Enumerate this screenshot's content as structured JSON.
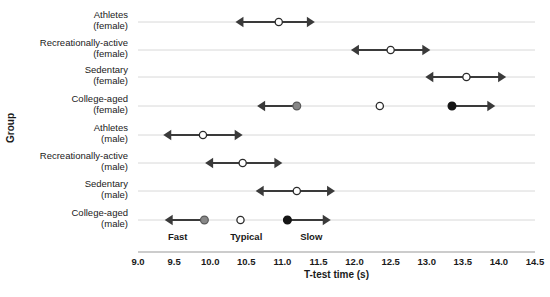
{
  "chart_data": {
    "type": "scatter",
    "title": "",
    "xlabel": "T-test time (s)",
    "ylabel": "Group",
    "xlim": [
      9.0,
      14.5
    ],
    "grid": true,
    "legend": "none",
    "xticks": [
      "9.0",
      "9.5",
      "10.0",
      "10.5",
      "11.0",
      "11.5",
      "12.0",
      "12.5",
      "13.0",
      "13.5",
      "14.0",
      "14.5"
    ],
    "xtick_values": [
      9.0,
      9.5,
      10.0,
      10.5,
      11.0,
      11.5,
      12.0,
      12.5,
      13.0,
      13.5,
      14.0,
      14.5
    ],
    "categories": [
      "Athletes\n(female)",
      "Recreationally-active\n(female)",
      "Sedentary\n(female)",
      "College-aged\n(female)",
      "Athletes\n(male)",
      "Recreationally-active\n(male)",
      "Sedentary\n(male)",
      "College-aged\n(male)"
    ],
    "category_lines": [
      [
        "Athletes",
        "(female)"
      ],
      [
        "Recreationally-active",
        "(female)"
      ],
      [
        "Sedentary",
        "(female)"
      ],
      [
        "College-aged",
        "(female)"
      ],
      [
        "Athletes",
        "(male)"
      ],
      [
        "Recreationally-active",
        "(male)"
      ],
      [
        "Sedentary",
        "(male)"
      ],
      [
        "College-aged",
        "(male)"
      ]
    ],
    "zone_labels": [
      {
        "text": "Fast",
        "x": 9.55
      },
      {
        "text": "Typical",
        "x": 10.5
      },
      {
        "text": "Slow",
        "x": 11.4
      }
    ],
    "rows": [
      {
        "group": "Athletes (female)",
        "points": [
          {
            "value": 10.95,
            "marker": "open",
            "range_start": 10.35,
            "range_end": 11.45,
            "arrow_left": true,
            "arrow_right": true
          }
        ]
      },
      {
        "group": "Recreationally-active (female)",
        "points": [
          {
            "value": 12.5,
            "marker": "open",
            "range_start": 11.95,
            "range_end": 13.05,
            "arrow_left": true,
            "arrow_right": true
          }
        ]
      },
      {
        "group": "Sedentary (female)",
        "points": [
          {
            "value": 13.55,
            "marker": "open",
            "range_start": 12.98,
            "range_end": 14.1,
            "arrow_left": true,
            "arrow_right": true
          }
        ]
      },
      {
        "group": "College-aged (female)",
        "points": [
          {
            "value": 11.2,
            "marker": "gray",
            "range_start": 10.65,
            "range_end": 11.2,
            "arrow_left": true,
            "arrow_right": false
          },
          {
            "value": 12.35,
            "marker": "open",
            "range_start": null,
            "range_end": null,
            "arrow_left": false,
            "arrow_right": false
          },
          {
            "value": 13.35,
            "marker": "black",
            "range_start": 13.35,
            "range_end": 13.95,
            "arrow_left": false,
            "arrow_right": true
          }
        ]
      },
      {
        "group": "Athletes (male)",
        "points": [
          {
            "value": 9.9,
            "marker": "open",
            "range_start": 9.35,
            "range_end": 10.45,
            "arrow_left": true,
            "arrow_right": true
          }
        ]
      },
      {
        "group": "Recreationally-active (male)",
        "points": [
          {
            "value": 10.45,
            "marker": "open",
            "range_start": 9.93,
            "range_end": 11.0,
            "arrow_left": true,
            "arrow_right": true
          }
        ]
      },
      {
        "group": "Sedentary (male)",
        "points": [
          {
            "value": 11.2,
            "marker": "open",
            "range_start": 10.63,
            "range_end": 11.73,
            "arrow_left": true,
            "arrow_right": true
          }
        ]
      },
      {
        "group": "College-aged (male)",
        "points": [
          {
            "value": 9.92,
            "marker": "gray",
            "range_start": 9.37,
            "range_end": 9.92,
            "arrow_left": true,
            "arrow_right": false
          },
          {
            "value": 10.42,
            "marker": "open",
            "range_start": null,
            "range_end": null,
            "arrow_left": false,
            "arrow_right": false
          },
          {
            "value": 11.07,
            "marker": "black",
            "range_start": 11.07,
            "range_end": 11.67,
            "arrow_left": false,
            "arrow_right": true
          }
        ]
      }
    ]
  },
  "colors": {
    "marker_open_fill": "#ffffff",
    "marker_gray_fill": "#878787",
    "marker_black_fill": "#151515",
    "range_line": "#3a3a3a",
    "gridline": "#d8d8d8",
    "axis_line": "#9a9a9a",
    "text": "#1a1a1a"
  }
}
